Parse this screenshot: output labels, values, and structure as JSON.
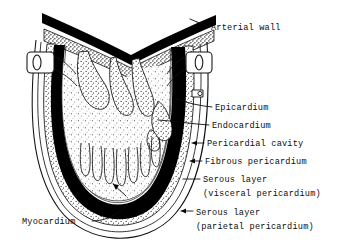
{
  "figure": {
    "style": "black-and-white line drawing with stipple shading",
    "background_color": "#ffffff",
    "ink_color": "#000000"
  },
  "labels": [
    {
      "id": "arterial-wall",
      "text": "Arterial wall",
      "x": 211,
      "y": 30
    },
    {
      "id": "epicardium",
      "text": "Epicardium",
      "x": 215,
      "y": 110
    },
    {
      "id": "endocardium",
      "text": "Endocardium",
      "x": 212,
      "y": 128
    },
    {
      "id": "pericardial-cavity",
      "text": "Pericardial cavity",
      "x": 207,
      "y": 146
    },
    {
      "id": "fibrous-pericardium",
      "text": "Fibrous pericardium",
      "x": 205,
      "y": 164
    },
    {
      "id": "serous-visceral-1",
      "text": "Serous layer",
      "x": 203,
      "y": 182
    },
    {
      "id": "serous-visceral-2",
      "text": "(visceral pericardium)",
      "x": 203,
      "y": 196
    },
    {
      "id": "serous-parietal-1",
      "text": "Serous layer",
      "x": 196,
      "y": 215
    },
    {
      "id": "serous-parietal-2",
      "text": "(parietal pericardium)",
      "x": 196,
      "y": 229
    },
    {
      "id": "myocardium",
      "text": "Myocardium",
      "x": 22,
      "y": 224
    }
  ],
  "structures": [
    {
      "id": "arterial-wall-band",
      "name": "Arterial wall",
      "description": "V-shaped double band across the top with dense black outer layer and stippled inner layer"
    },
    {
      "id": "great-vessel-left",
      "name": "Left great vessel stub",
      "description": "Rounded rectangle vessel cut with oval lumen on upper left"
    },
    {
      "id": "great-vessel-right",
      "name": "Right great vessel stub",
      "description": "Rounded rectangle vessel cut with oval lumen on upper right"
    },
    {
      "id": "valve-leaflets",
      "name": "Valve leaflets / septum",
      "description": "Stippled leaflet shapes hanging into the chamber from above"
    },
    {
      "id": "trabeculae",
      "name": "Trabeculae carneae",
      "description": "Finger-like muscular projections along the chamber floor"
    },
    {
      "id": "ventricular-cavity",
      "name": "Ventricular cavity",
      "description": "Large stippled chamber occupying the centre of the heart"
    },
    {
      "id": "myocardium-band",
      "name": "Myocardium",
      "description": "Thick solid black muscular wall surrounding the cavity"
    },
    {
      "id": "epicardium-band",
      "name": "Epicardium",
      "description": "Thin layer immediately outside the myocardium"
    },
    {
      "id": "serous-visceral-band",
      "name": "Serous layer (visceral pericardium)",
      "description": "Stippled layer on the outer heart surface"
    },
    {
      "id": "pericardial-cavity-gap",
      "name": "Pericardial cavity",
      "description": "Narrow clear space between visceral and parietal serous layers"
    },
    {
      "id": "serous-parietal-band",
      "name": "Serous layer (parietal pericardium)",
      "description": "Thin outer serous lining of the pericardial sac"
    },
    {
      "id": "fibrous-pericardium-band",
      "name": "Fibrous pericardium",
      "description": "Outermost tough fibrous sac enclosing the heart"
    }
  ]
}
